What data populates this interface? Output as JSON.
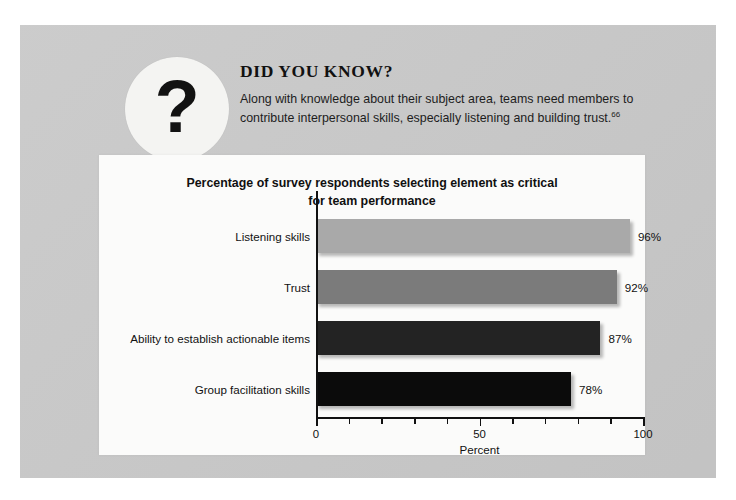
{
  "page": {
    "background_color": "#ffffff",
    "panel_color": "#c9c9c9"
  },
  "callout": {
    "icon_name": "question-mark-icon",
    "icon_glyph": "?",
    "heading": "DID YOU KNOW?",
    "body_text": "Along with knowledge about their subject area, teams need members to contribute interpersonal skills, especially listening and building trust.",
    "footnote_marker": "66"
  },
  "chart_data": {
    "type": "bar",
    "orientation": "horizontal",
    "title": "Percentage of survey respondents selecting element as critical for team performance",
    "title_line_1": "Percentage of survey respondents selecting element as critical",
    "title_line_2": "for team performance",
    "xlabel": "Percent",
    "ylabel": "",
    "categories": [
      "Listening skills",
      "Trust",
      "Ability to establish actionable items",
      "Group facilitation skills"
    ],
    "values": [
      96,
      92,
      87,
      78
    ],
    "value_labels": [
      "96%",
      "92%",
      "87%",
      "78%"
    ],
    "bar_colors": [
      "#a9a9a9",
      "#7b7b7b",
      "#232323",
      "#0b0b0b"
    ],
    "xlim": [
      0,
      100
    ],
    "xticks": [
      0,
      10,
      20,
      30,
      40,
      50,
      60,
      70,
      80,
      90,
      100
    ],
    "xtick_labels": [
      "0",
      "",
      "",
      "",
      "",
      "50",
      "",
      "",
      "",
      "",
      "100"
    ],
    "major_xticks": [
      0,
      50,
      100
    ],
    "grid": false,
    "legend": "none"
  }
}
